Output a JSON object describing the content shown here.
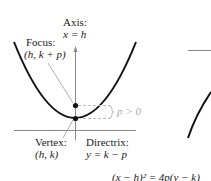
{
  "labels": {
    "axis_title": "Axis:",
    "axis_eq": "x = h",
    "focus_title": "Focus:",
    "focus_coord": "(h, k + p)",
    "vertex_title": "Vertex:",
    "vertex_coord": "(h, k)",
    "directrix_title": "Directrix:",
    "directrix_eq": "y = k − p",
    "p_condition": "p > 0",
    "equation": "(x − h)² = 4p(y − k)"
  },
  "colors": {
    "curve": "#111111",
    "axis": "#888888",
    "leader": "#999999",
    "dashed": "#bbbbbb",
    "text": "#222222"
  }
}
